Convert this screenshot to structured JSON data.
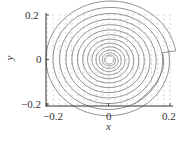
{
  "chart_data": {
    "type": "line",
    "subtype": "phase-portrait",
    "title": "",
    "xlabel": "x",
    "ylabel": "y",
    "xlim": [
      -0.2,
      0.2
    ],
    "ylim": [
      -0.2,
      0.2
    ],
    "xticks": [
      "-0.2",
      "0",
      "0.2"
    ],
    "yticks": [
      "0.2",
      "0",
      "-0.2"
    ],
    "grid": false,
    "legend": null,
    "vector_field": {
      "color": "#c8c8c8",
      "description": "direction arrows on a grid over the domain"
    },
    "series": [
      {
        "name": "trajectory",
        "kind": "inward spiral",
        "color": "#777777",
        "start": [
          0.085,
          -0.2
        ],
        "center": [
          0.0,
          0.0
        ],
        "description": "trajectory enters from bottom edge, spirals counter-clockwise inward to the origin; dense windings near center with a small empty hole at the equilibrium"
      }
    ],
    "equilibrium": [
      0.0,
      0.0
    ]
  },
  "axes": {
    "x_tick_labels": [
      "−0.2",
      "0",
      "0.2"
    ],
    "y_tick_labels": [
      "0.2",
      "0",
      "−0.2"
    ],
    "x_label": "x",
    "y_label": "y"
  }
}
